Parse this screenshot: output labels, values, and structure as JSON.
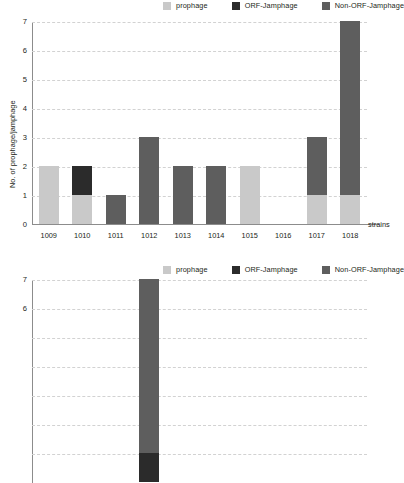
{
  "chart_data": [
    {
      "type": "bar",
      "id": "top",
      "title": "",
      "subtitle": "",
      "xlabel": "strains",
      "ylabel": "No. of prophage/jamphage",
      "stacked": true,
      "grid": true,
      "legend_position": "top-right",
      "ylim": [
        0,
        7
      ],
      "yticks": [
        "0",
        "1",
        "2",
        "3",
        "4",
        "5",
        "6",
        "7"
      ],
      "categories": [
        "1009",
        "1010",
        "1011",
        "1012",
        "1013",
        "1014",
        "1015",
        "1016",
        "1017",
        "1018"
      ],
      "series": [
        {
          "name": "prophage",
          "color": "#c9c9c9",
          "values": [
            2,
            1,
            0,
            0,
            0,
            0,
            2,
            0,
            1,
            1
          ]
        },
        {
          "name": "ORF-Jamphage",
          "color": "#2b2b2b",
          "values": [
            0,
            1,
            0,
            0,
            0,
            0,
            0,
            0,
            0,
            0
          ]
        },
        {
          "name": "Non-ORF-Jamphage",
          "color": "#5e5e5e",
          "values": [
            0,
            0,
            1,
            3,
            2,
            2,
            0,
            0,
            2,
            6
          ]
        }
      ],
      "totals": [
        2,
        2,
        1,
        3,
        2,
        2,
        2,
        0,
        3,
        7
      ]
    },
    {
      "type": "bar",
      "id": "bottom",
      "title": "",
      "subtitle": "",
      "xlabel": "",
      "ylabel": "",
      "stacked": true,
      "grid": true,
      "legend_position": "top-right",
      "ylim": [
        0,
        7
      ],
      "yticks": [
        "6",
        "7"
      ],
      "categories": [
        "",
        ""
      ],
      "series": [
        {
          "name": "prophage",
          "color": "#c9c9c9",
          "values": [
            0,
            0
          ]
        },
        {
          "name": "ORF-Jamphage",
          "color": "#2b2b2b",
          "values": [
            0,
            1
          ]
        },
        {
          "name": "Non-ORF-Jamphage",
          "color": "#5e5e5e",
          "values": [
            7,
            6
          ]
        }
      ],
      "totals": [
        7,
        7
      ]
    }
  ],
  "legend": {
    "items": [
      {
        "label": "prophage",
        "color": "#c9c9c9"
      },
      {
        "label": "ORF-Jamphage",
        "color": "#2b2b2b"
      },
      {
        "label": "Non-ORF-Jamphage",
        "color": "#5e5e5e"
      }
    ]
  },
  "colors": {
    "axis": "#8c8c8c",
    "grid": "#d2d2d2",
    "text": "#231f20",
    "background": "#ffffff"
  }
}
